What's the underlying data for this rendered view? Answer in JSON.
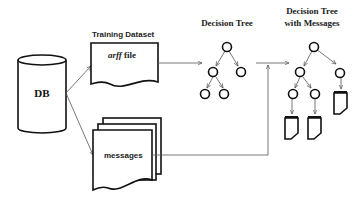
{
  "diagram": {
    "database": {
      "label": "DB"
    },
    "training_dataset": {
      "title": "Training Dataset",
      "file_prefix": "arff",
      "file_suffix": " file"
    },
    "messages": {
      "label": "messages"
    },
    "decision_tree": {
      "title": "Decision Tree"
    },
    "decision_tree_with_messages": {
      "title_line1": "Decision Tree",
      "title_line2": "with Messages"
    },
    "flows": [
      {
        "from": "DB",
        "to": "arff file"
      },
      {
        "from": "DB",
        "to": "messages"
      },
      {
        "from": "arff file",
        "to": "Decision Tree"
      },
      {
        "from": "Decision Tree",
        "to": "Decision Tree with Messages"
      },
      {
        "from": "messages",
        "to": "Decision Tree with Messages"
      }
    ],
    "colors": {
      "stroke": "#111111",
      "connector": "#555555",
      "background": "#ffffff"
    }
  }
}
